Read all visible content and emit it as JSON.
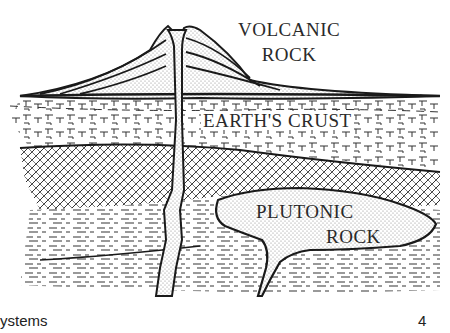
{
  "diagram": {
    "labels": {
      "volcanic_line1": "VOLCANIC",
      "volcanic_line2": "ROCK",
      "crust": "EARTH'S CRUST",
      "plutonic_line1": "PLUTONIC",
      "plutonic_line2": "ROCK"
    },
    "colors": {
      "ink": "#1a1a1a",
      "paper": "#ffffff",
      "stipple": "#9a9a9a"
    }
  },
  "footer": {
    "left_text": "ystems",
    "page_number": "4"
  }
}
